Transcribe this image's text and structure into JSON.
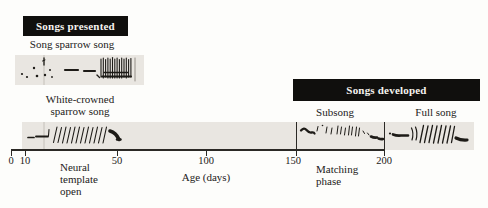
{
  "figure_title": "Song learning timeline",
  "banners": {
    "songs_presented": "Songs presented",
    "songs_developed": "Songs developed"
  },
  "labels": {
    "song_sparrow": "Song sparrow song",
    "white_crowned_line1": "White-crowned",
    "white_crowned_line2": "sparrow song",
    "subsong": "Subsong",
    "full_song": "Full song",
    "neural_template_line1": "Neural",
    "neural_template_line2": "template",
    "neural_template_line3": "open",
    "matching_line1": "Matching",
    "matching_line2": "phase",
    "age_axis": "Age (days)"
  },
  "axis": {
    "unit": "days",
    "ticks": [
      {
        "value": "0",
        "x": 11
      },
      {
        "value": "10",
        "x": 25
      },
      {
        "value": "50",
        "x": 117
      },
      {
        "value": "100",
        "x": 206
      },
      {
        "value": "150",
        "x": 296
      },
      {
        "value": "200",
        "x": 384
      }
    ]
  },
  "phases": [
    {
      "name": "Neural template open",
      "start_day": 10,
      "end_day": 50
    },
    {
      "name": "Silent gap",
      "start_day": 50,
      "end_day": 150
    },
    {
      "name": "Subsong / Matching phase",
      "start_day": 150,
      "end_day": 200
    },
    {
      "name": "Full song",
      "start_day": 200,
      "end_day": 230
    }
  ],
  "colors": {
    "banner_bg": "#100f0d",
    "banner_text": "#f6f4f0",
    "strip_bg": "#e9e6e1",
    "ink": "#232120",
    "page_bg": "#fdfdfb"
  }
}
